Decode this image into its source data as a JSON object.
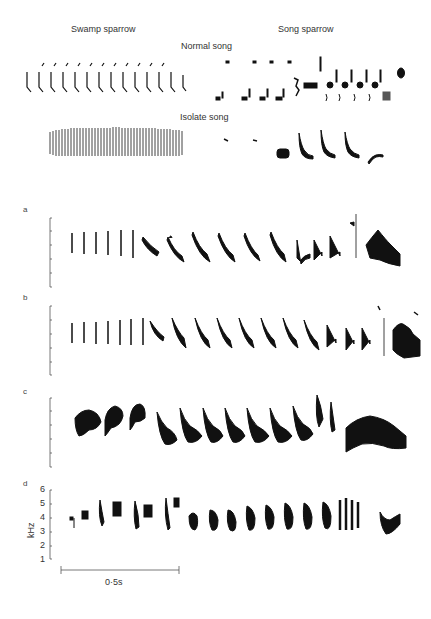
{
  "header": {
    "swamp_label": "Swamp sparrow",
    "song_label": "Song sparrow",
    "normal_label": "Normal song",
    "isolate_label": "Isolate song"
  },
  "panels": {
    "a": "a",
    "b": "b",
    "c": "c",
    "d": "d"
  },
  "axis": {
    "ylabel": "kHz",
    "ticks": [
      "6",
      "5",
      "4",
      "3",
      "2",
      "1"
    ],
    "scale_bar": "0·5s"
  },
  "colors": {
    "ink": "#111111",
    "axis": "#555555",
    "background": "#ffffff"
  }
}
